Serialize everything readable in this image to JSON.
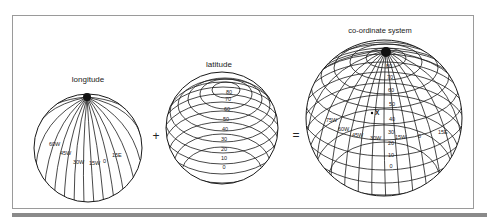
{
  "diagram": {
    "panels": [
      {
        "title": "longitude",
        "type": "meridians",
        "labels": [
          "60W",
          "45W",
          "30W",
          "15W",
          "0",
          "15E"
        ]
      },
      {
        "title": "latitude",
        "type": "parallels",
        "labels": [
          "80",
          "70",
          "60",
          "50",
          "40",
          "30",
          "20",
          "10",
          "0"
        ]
      },
      {
        "title": "co-ordinate system",
        "type": "graticule",
        "longitude_labels": [
          "75W",
          "60W",
          "45W",
          "30W",
          "15W",
          "0",
          "15E"
        ],
        "latitude_labels": [
          "80",
          "70",
          "60",
          "50",
          "40",
          "30",
          "20",
          "10",
          "0"
        ],
        "point_label": "X"
      }
    ],
    "operators": [
      "+",
      "="
    ],
    "colors": {
      "line": "#1a1a1a",
      "frame": "#9a9a9a",
      "background": "#ffffff"
    }
  }
}
